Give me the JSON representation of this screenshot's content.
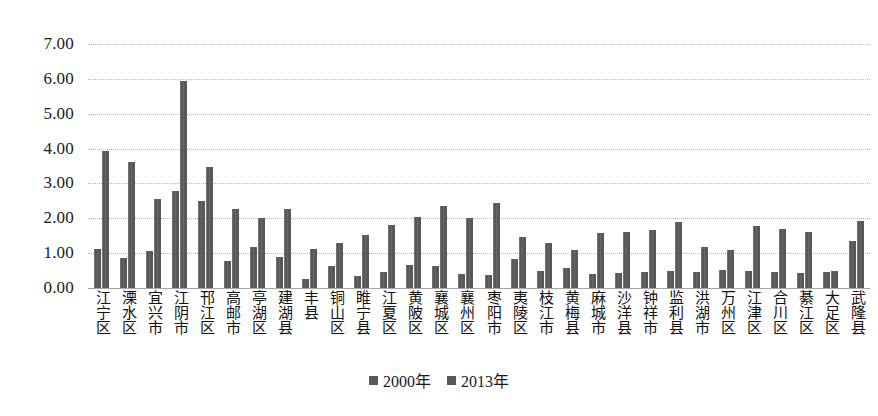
{
  "chart_data": {
    "type": "bar",
    "title": "",
    "subtitle": "",
    "xlabel": "",
    "ylabel": "",
    "ylim": [
      0,
      7
    ],
    "ytick_labels": [
      "0.00",
      "1.00",
      "2.00",
      "3.00",
      "4.00",
      "5.00",
      "6.00",
      "7.00"
    ],
    "ytick_values": [
      0,
      1,
      2,
      3,
      4,
      5,
      6,
      7
    ],
    "grid": true,
    "legend_position": "bottom",
    "bar_color": "#585858",
    "categories": [
      "江宁区",
      "溧水区",
      "宜兴市",
      "江阴市",
      "邗江区",
      "高邮市",
      "亭湖区",
      "建湖县",
      "丰县",
      "铜山区",
      "睢宁县",
      "江夏区",
      "黄陂区",
      "襄城区",
      "襄州区",
      "枣阳市",
      "夷陵区",
      "枝江市",
      "黄梅县",
      "麻城市",
      "沙洋县",
      "钟祥市",
      "监利县",
      "洪湖市",
      "万州区",
      "江津区",
      "合川区",
      "綦江区",
      "大足区",
      "武隆县"
    ],
    "series": [
      {
        "name": "2000年",
        "values": [
          1.13,
          0.86,
          1.07,
          2.78,
          2.5,
          0.77,
          1.18,
          0.88,
          0.26,
          0.62,
          0.35,
          0.45,
          0.65,
          0.63,
          0.4,
          0.38,
          0.83,
          0.5,
          0.58,
          0.4,
          0.43,
          0.45,
          0.48,
          0.45,
          0.53,
          0.48,
          0.45,
          0.42,
          0.45,
          1.35
        ]
      },
      {
        "name": "2013年",
        "values": [
          3.93,
          3.62,
          2.55,
          5.95,
          3.47,
          2.28,
          2.0,
          2.28,
          1.13,
          1.28,
          1.52,
          1.82,
          2.05,
          2.35,
          2.02,
          2.43,
          1.47,
          1.28,
          1.1,
          1.57,
          1.6,
          1.67,
          1.88,
          1.18,
          1.08,
          1.78,
          1.68,
          1.62,
          0.5,
          1.92
        ]
      }
    ],
    "legend": [
      "2000年",
      "2013年"
    ]
  }
}
